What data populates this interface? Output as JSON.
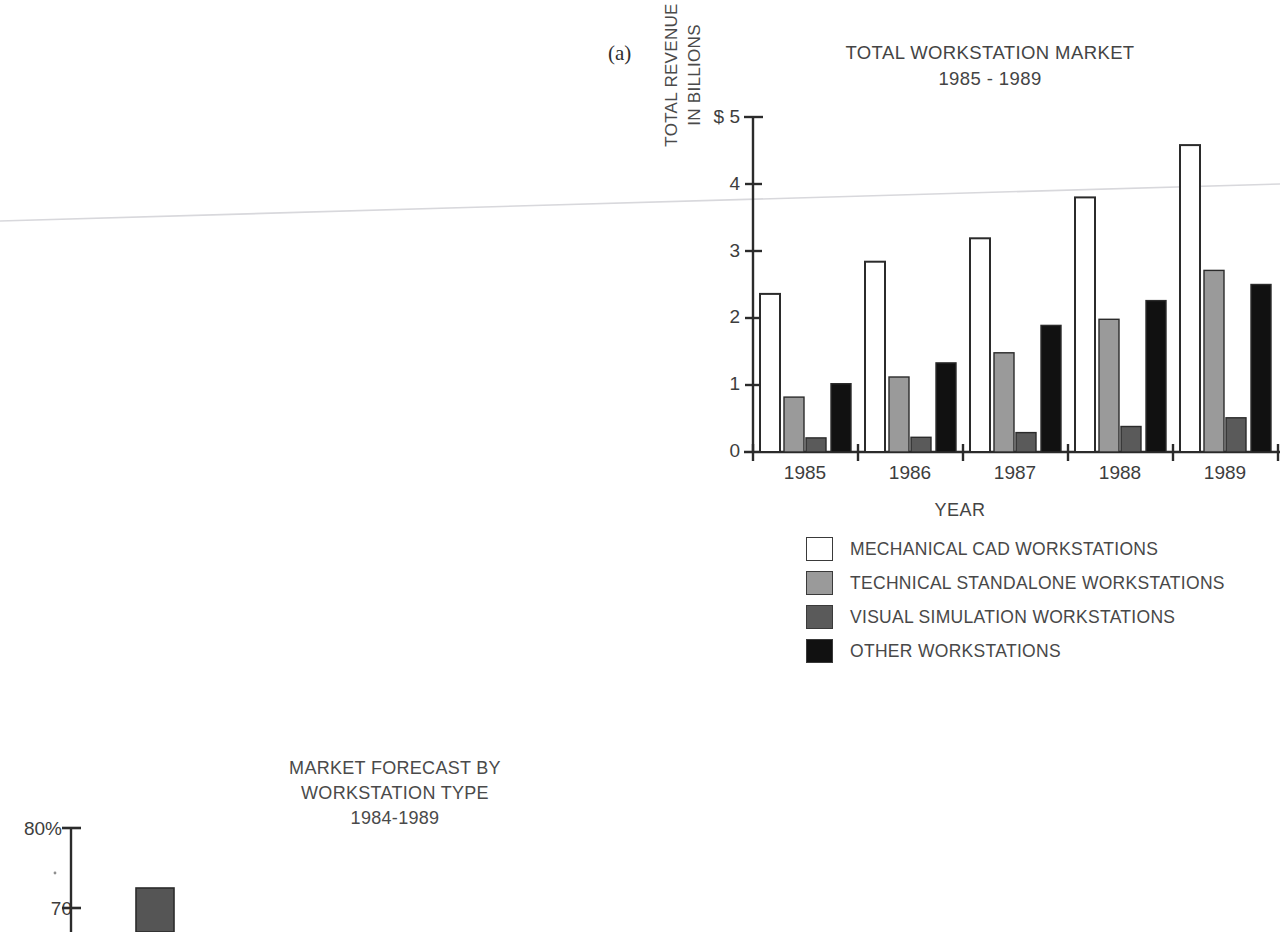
{
  "panel_label": "(a)",
  "chart_a": {
    "title_line1": "TOTAL WORKSTATION MARKET",
    "title_line2": "1985 - 1989",
    "y_caption_line1": "TOTAL REVENUE",
    "y_caption_line2": "IN BILLIONS",
    "x_axis_title": "YEAR",
    "y_ticks": [
      "$ 5",
      "4",
      "3",
      "2",
      "1",
      "0"
    ],
    "legend": [
      {
        "label": "MECHANICAL CAD WORKSTATIONS",
        "color": "#ffffff"
      },
      {
        "label": "TECHNICAL STANDALONE WORKSTATIONS",
        "color": "#9a9a9a"
      },
      {
        "label": "VISUAL SIMULATION WORKSTATIONS",
        "color": "#5a5a5a"
      },
      {
        "label": "OTHER WORKSTATIONS",
        "color": "#111111"
      }
    ]
  },
  "chart_b": {
    "title_line1": "MARKET FORECAST BY",
    "title_line2": "WORKSTATION TYPE",
    "title_line3": "1984-1989",
    "y_ticks": [
      "80%",
      "70"
    ]
  },
  "chart_data": [
    {
      "type": "bar",
      "title": "TOTAL WORKSTATION MARKET 1985 - 1989",
      "xlabel": "YEAR",
      "ylabel": "TOTAL REVENUE IN BILLIONS",
      "ylim": [
        0,
        5
      ],
      "ytick_labels": [
        "0",
        "1",
        "2",
        "3",
        "4",
        "$ 5"
      ],
      "ytick_values": [
        0,
        1,
        2,
        3,
        4,
        5
      ],
      "grid": false,
      "legend_position": "below",
      "categories": [
        "1985",
        "1986",
        "1987",
        "1988",
        "1989"
      ],
      "series": [
        {
          "name": "MECHANICAL CAD WORKSTATIONS",
          "color": "#ffffff",
          "values": [
            2.36,
            2.84,
            3.19,
            3.8,
            4.58
          ]
        },
        {
          "name": "TECHNICAL STANDALONE WORKSTATIONS",
          "color": "#9a9a9a",
          "values": [
            0.82,
            1.12,
            1.48,
            1.98,
            2.71
          ]
        },
        {
          "name": "VISUAL SIMULATION WORKSTATIONS",
          "color": "#5a5a5a",
          "values": [
            0.21,
            0.22,
            0.29,
            0.38,
            0.51
          ]
        },
        {
          "name": "OTHER WORKSTATIONS",
          "color": "#111111",
          "values": [
            1.02,
            1.33,
            1.89,
            2.26,
            2.5
          ]
        }
      ]
    },
    {
      "type": "bar",
      "title": "MARKET FORECAST BY WORKSTATION TYPE 1984-1989",
      "xlabel": "",
      "ylabel": "",
      "ylim": [
        65,
        82
      ],
      "ytick_labels": [
        "70",
        "80%"
      ],
      "ytick_values": [
        70,
        80
      ],
      "grid": false,
      "note": "chart cropped by bottom edge of page",
      "categories": [
        ""
      ],
      "series": [
        {
          "name": "bar-1",
          "color": "#555555",
          "values": [
            73.2
          ]
        }
      ]
    }
  ]
}
